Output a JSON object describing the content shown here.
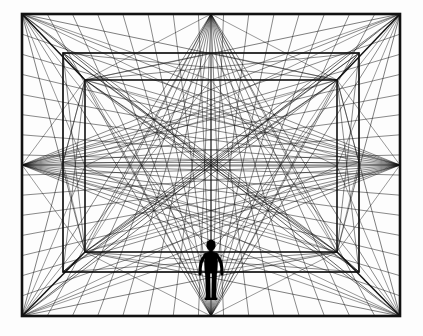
{
  "figure": {
    "type": "line-drawing",
    "background_color": "#fdfdfd",
    "line_color": "#111111",
    "silhouette_color": "#000000",
    "canvas": {
      "width": 423,
      "height": 336
    }
  },
  "geometry": {
    "vanishing_point": {
      "x": 211,
      "y": 165
    },
    "rectangles": [
      {
        "name": "outer-frame",
        "x1": 22,
        "y1": 14,
        "x2": 400,
        "y2": 316,
        "stroke_width": 2.6
      },
      {
        "name": "second-rect",
        "x1": 63,
        "y1": 53,
        "x2": 359,
        "y2": 272,
        "stroke_width": 1.7
      },
      {
        "name": "inner-rect",
        "x1": 85,
        "y1": 80,
        "x2": 337,
        "y2": 252,
        "stroke_width": 1.6
      }
    ],
    "edge_midpoints": [
      {
        "name": "top-mid",
        "x": 211,
        "y": 14
      },
      {
        "name": "bottom-mid",
        "x": 211,
        "y": 316
      },
      {
        "name": "left-mid",
        "x": 22,
        "y": 165
      },
      {
        "name": "right-mid",
        "x": 400,
        "y": 165
      }
    ],
    "fan_ray_count": 15,
    "has_center_cross": true,
    "has_corner_diagonals": true
  },
  "human_figure": {
    "name": "human-silhouette",
    "center_x": 211,
    "head_top_y": 240,
    "feet_y": 300,
    "height_px": 60,
    "pose": "standing, arms slightly away from body",
    "fill": "#000000"
  }
}
